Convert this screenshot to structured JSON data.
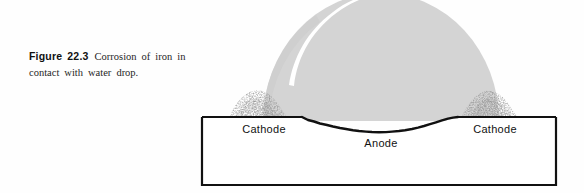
{
  "figure": {
    "caption": {
      "label": "Figure",
      "number": "22.3",
      "text": "Corrosion of iron in contact with water drop."
    }
  },
  "diagram": {
    "title": "Corrosion of iron in contact with water drop",
    "labels": {
      "cathode_left": "Cathode",
      "anode": "Anode",
      "cathode_right": "Cathode"
    },
    "elements": {
      "water_drop": "water-drop",
      "highlight": "specular-highlight",
      "rust_left": "rust-deposit-left",
      "rust_right": "rust-deposit-right",
      "metal_block": "iron-metal-block",
      "pit": "corrosion-pit"
    },
    "colors": {
      "drop_fill": "#d4d4d4",
      "highlight": "#ffffff",
      "metal_outline": "#111111",
      "metal_fill": "#ffffff",
      "rust": "#4a4a4a",
      "page_background": "#ffffff"
    }
  }
}
